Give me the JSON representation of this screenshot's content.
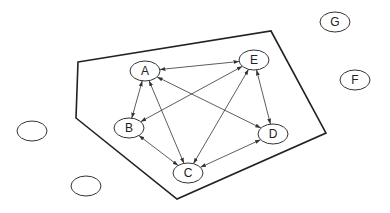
{
  "diagram": {
    "type": "graph",
    "region": {
      "points": [
        [
          78,
          62
        ],
        [
          271,
          31
        ],
        [
          326,
          133
        ],
        [
          177,
          199
        ],
        [
          76,
          118
        ]
      ],
      "stroke": "#222222"
    },
    "nodes": [
      {
        "id": "A",
        "label": "A",
        "cx": 145,
        "cy": 71,
        "rx": 15,
        "ry": 10
      },
      {
        "id": "B",
        "label": "B",
        "cx": 129,
        "cy": 128,
        "rx": 15,
        "ry": 10
      },
      {
        "id": "C",
        "label": "C",
        "cx": 188,
        "cy": 173,
        "rx": 15,
        "ry": 10
      },
      {
        "id": "D",
        "label": "D",
        "cx": 273,
        "cy": 134,
        "rx": 15,
        "ry": 10
      },
      {
        "id": "E",
        "label": "E",
        "cx": 254,
        "cy": 60,
        "rx": 15,
        "ry": 10
      },
      {
        "id": "F",
        "label": "F",
        "cx": 355,
        "cy": 80,
        "rx": 15,
        "ry": 10
      },
      {
        "id": "G",
        "label": "G",
        "cx": 335,
        "cy": 22,
        "rx": 15,
        "ry": 10
      },
      {
        "id": "empty1",
        "label": "",
        "cx": 32,
        "cy": 131,
        "rx": 15,
        "ry": 10
      },
      {
        "id": "empty2",
        "label": "",
        "cx": 86,
        "cy": 186,
        "rx": 15,
        "ry": 10
      }
    ],
    "edges": [
      {
        "from": "A",
        "to": "E",
        "directed": "both"
      },
      {
        "from": "A",
        "to": "B",
        "directed": "both"
      },
      {
        "from": "A",
        "to": "C",
        "directed": "both"
      },
      {
        "from": "A",
        "to": "D",
        "directed": "both"
      },
      {
        "from": "E",
        "to": "B",
        "directed": "both"
      },
      {
        "from": "E",
        "to": "C",
        "directed": "both"
      },
      {
        "from": "E",
        "to": "D",
        "directed": "both"
      },
      {
        "from": "B",
        "to": "C",
        "directed": "both"
      },
      {
        "from": "C",
        "to": "D",
        "directed": "both"
      }
    ]
  }
}
